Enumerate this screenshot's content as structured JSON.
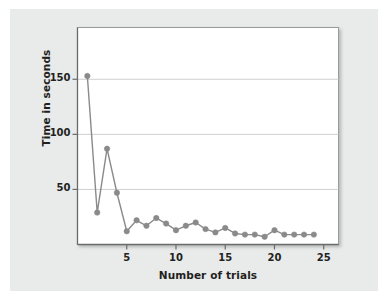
{
  "chart_data": {
    "type": "line",
    "title": "",
    "subtitle": "",
    "xlabel": "Number of trials",
    "ylabel": "Time in seconds",
    "x": [
      1,
      2,
      3,
      4,
      5,
      6,
      7,
      8,
      9,
      10,
      11,
      12,
      13,
      14,
      15,
      16,
      17,
      18,
      19,
      20,
      21,
      22,
      23,
      24
    ],
    "values": [
      153,
      29,
      87,
      47,
      12,
      22,
      17,
      24,
      19,
      13,
      17,
      20,
      14,
      11,
      15,
      10,
      9,
      9,
      7,
      13,
      9,
      9,
      9,
      9
    ],
    "series": [
      {
        "name": "Time in seconds",
        "values": [
          153,
          29,
          87,
          47,
          12,
          22,
          17,
          24,
          19,
          13,
          17,
          20,
          14,
          11,
          15,
          10,
          9,
          9,
          7,
          13,
          9,
          9,
          9,
          9
        ]
      }
    ],
    "xlim": [
      0,
      26.5
    ],
    "ylim": [
      0,
      197
    ],
    "xticks": [
      5,
      10,
      15,
      20,
      25
    ],
    "xtick_labels": [
      "5",
      "10",
      "15",
      "20",
      "25"
    ],
    "yticks": [
      50,
      100,
      150
    ],
    "ytick_labels": [
      "50",
      "100",
      "150"
    ],
    "grid": "horizontal",
    "legend": "none",
    "marker": "circle",
    "colors": {
      "line": "#8a8a8a",
      "marker": "#8a8a8a",
      "gridline": "#cfcfcf",
      "axis": "#6b6b6b",
      "plot_background": "#ffffff",
      "panel_background": "#e9eaea",
      "text": "#231f20"
    }
  }
}
